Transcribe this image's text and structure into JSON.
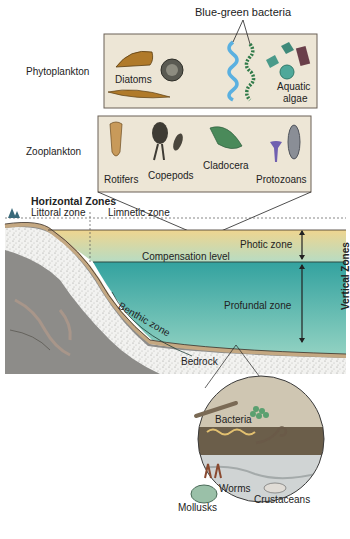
{
  "plankton": {
    "blue_green_callout": "Blue-green bacteria",
    "phyto": {
      "row_label": "Phytoplankton",
      "items": [
        "Diatoms",
        "Aquatic",
        "algae"
      ]
    },
    "zoo": {
      "row_label": "Zooplankton",
      "items": [
        "Rotifers",
        "Copepods",
        "Cladocera",
        "Protozoans"
      ]
    }
  },
  "lake": {
    "horizontal_title": "Horizontal Zones",
    "littoral": "Littoral zone",
    "limnetic": "Limnetic zone",
    "photic": "Photic zone",
    "compensation": "Compensation level",
    "profundal": "Profundal zone",
    "benthic": "Benthic zone",
    "bedrock": "Bedrock",
    "vertical_title": "Vertical Zones"
  },
  "benthic_inset": {
    "items": [
      "Bacteria",
      "Worms",
      "Crustaceans",
      "Mollusks"
    ]
  },
  "colors": {
    "box_fill": "#ede6d6",
    "photic_top": "#efd79a",
    "photic_bottom": "#b9dcc0",
    "profundal_top": "#3aa6a2",
    "profundal_bottom": "#8ccfc0",
    "sediment": "#c9b08e",
    "rock": "#8d8c89"
  }
}
